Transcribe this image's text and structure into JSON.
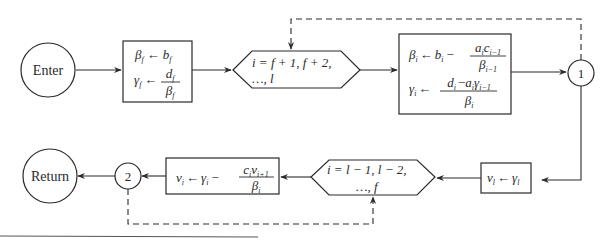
{
  "diagram": {
    "type": "flowchart",
    "nodes": {
      "enter": {
        "label": "Enter",
        "shape": "circle"
      },
      "init_box": {
        "shape": "rectangle",
        "line1": {
          "lhs": "β",
          "lhs_sub": "f",
          "arrow": "←",
          "rhs": "b",
          "rhs_sub": "f"
        },
        "line2": {
          "lhs": "γ",
          "lhs_sub": "f",
          "arrow": "←",
          "num": "d",
          "num_sub": "f",
          "den": "β",
          "den_sub": "f"
        }
      },
      "loop_forward": {
        "shape": "hexagon",
        "line1": "i = f + 1, f + 2,",
        "line2": "…, l"
      },
      "forward_box": {
        "shape": "rectangle",
        "line1": {
          "lhs": "β",
          "lhs_sub": "i",
          "arrow": "←",
          "pre": "b",
          "pre_sub": "i",
          "minus": "−",
          "num": "a",
          "num_sub": "i",
          "num2": "c",
          "num2_sub": "i−1",
          "den": "β",
          "den_sub": "i−1"
        },
        "line2": {
          "lhs": "γ",
          "lhs_sub": "i",
          "arrow": "←",
          "num": "d",
          "num_sub": "i",
          "minus": "−",
          "num2": "a",
          "num2_sub": "i",
          "num3": "γ",
          "num3_sub": "i−1",
          "den": "β",
          "den_sub": "i"
        }
      },
      "connector_1": {
        "label": "1",
        "shape": "circle"
      },
      "back_init_box": {
        "shape": "rectangle",
        "expr": {
          "lhs": "v",
          "lhs_sub": "l",
          "arrow": "←",
          "rhs": "γ",
          "rhs_sub": "l"
        }
      },
      "loop_backward": {
        "shape": "hexagon",
        "line1": "i = l − 1, l − 2,",
        "line2": "…, f"
      },
      "backward_box": {
        "shape": "rectangle",
        "expr": {
          "lhs": "v",
          "lhs_sub": "i",
          "arrow": "←",
          "pre": "γ",
          "pre_sub": "i",
          "minus": "−",
          "num": "c",
          "num_sub": "i",
          "num2": "v",
          "num2_sub": "i+1",
          "den": "β",
          "den_sub": "i"
        }
      },
      "connector_2": {
        "label": "2",
        "shape": "circle"
      },
      "return": {
        "label": "Return",
        "shape": "circle"
      }
    },
    "edges": [
      {
        "from": "enter",
        "to": "init_box",
        "style": "solid"
      },
      {
        "from": "init_box",
        "to": "loop_forward",
        "style": "solid"
      },
      {
        "from": "loop_forward",
        "to": "forward_box",
        "style": "solid"
      },
      {
        "from": "forward_box",
        "to": "connector_1",
        "style": "solid"
      },
      {
        "from": "connector_1",
        "to": "loop_forward",
        "style": "dashed"
      },
      {
        "from": "connector_1",
        "to": "back_init_box",
        "style": "solid"
      },
      {
        "from": "back_init_box",
        "to": "loop_backward",
        "style": "solid"
      },
      {
        "from": "loop_backward",
        "to": "backward_box",
        "style": "solid"
      },
      {
        "from": "backward_box",
        "to": "connector_2",
        "style": "solid"
      },
      {
        "from": "connector_2",
        "to": "loop_backward",
        "style": "dashed"
      },
      {
        "from": "connector_2",
        "to": "return",
        "style": "solid"
      }
    ],
    "colors": {
      "stroke": "#2a2a2a",
      "background": "#ffffff",
      "rule": "#555555"
    }
  }
}
